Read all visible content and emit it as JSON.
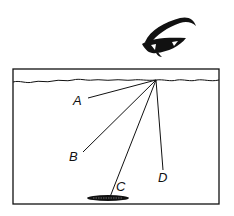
{
  "diagram": {
    "labels": {
      "A": "A",
      "B": "B",
      "C": "C",
      "D": "D"
    },
    "colors": {
      "ink": "#111111",
      "background": "#ffffff"
    }
  }
}
